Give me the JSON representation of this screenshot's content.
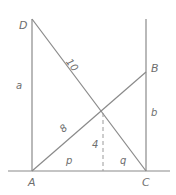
{
  "figure": {
    "stroke_color": "#8a8a8a",
    "label_color": "#6e6e6e",
    "background_color": "#ffffff",
    "vertices": [
      {
        "name": "D",
        "label": "D",
        "x": 32,
        "y": 19
      },
      {
        "name": "B",
        "label": "B",
        "x": 146,
        "y": 72
      },
      {
        "name": "A",
        "label": "A",
        "x": 32,
        "y": 171
      },
      {
        "name": "C",
        "label": "C",
        "x": 146,
        "y": 171
      }
    ],
    "foot": {
      "name": "foot-of-altitude",
      "x": 103,
      "y": 171
    },
    "intersection": {
      "name": "diagonal-intersection",
      "x": 103,
      "y": 113
    },
    "baseline": {
      "x1": 8,
      "y1": 171,
      "x2": 170,
      "y2": 171
    },
    "segments": [
      {
        "name": "left-vertical-AD",
        "label": "a",
        "x1": 32,
        "y1": 19,
        "x2": 32,
        "y2": 171
      },
      {
        "name": "right-vertical-CB",
        "label": "b",
        "x1": 146,
        "y1": 19,
        "x2": 146,
        "y2": 171
      },
      {
        "name": "diagonal-DC",
        "label": "10",
        "x1": 32,
        "y1": 19,
        "x2": 146,
        "y2": 171
      },
      {
        "name": "diagonal-AB",
        "label": "8",
        "x1": 32,
        "y1": 171,
        "x2": 146,
        "y2": 72
      },
      {
        "name": "altitude-dashed",
        "label": "4",
        "x1": 103,
        "y1": 113,
        "x2": 103,
        "y2": 171
      },
      {
        "name": "base-left-p",
        "label": "p",
        "x1": 32,
        "y1": 171,
        "x2": 103,
        "y2": 171
      },
      {
        "name": "base-right-q",
        "label": "q",
        "x1": 103,
        "y1": 171,
        "x2": 146,
        "y2": 171
      }
    ],
    "labels": {
      "vertex_d": "D",
      "vertex_b": "B",
      "vertex_a": "A",
      "vertex_c": "C",
      "side_a": "a",
      "side_b": "b",
      "diagonal_dc": "10",
      "diagonal_ab": "8",
      "altitude": "4",
      "base_left": "p",
      "base_right": "q"
    }
  }
}
